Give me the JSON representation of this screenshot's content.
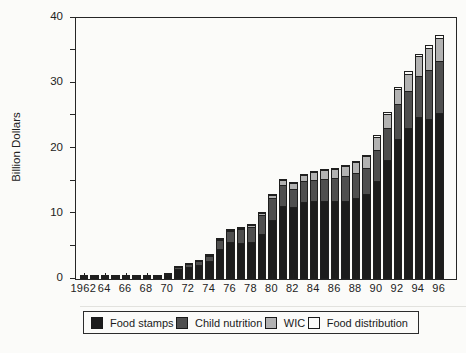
{
  "chart_data": {
    "type": "bar",
    "stacked": true,
    "title": "",
    "xlabel": "",
    "ylabel": "Billion Dollars",
    "ylim": [
      0,
      40
    ],
    "y_major_ticks": [
      0,
      10,
      20,
      30,
      40
    ],
    "y_minor_step": 5,
    "grid": "off",
    "legend_position": "bottom",
    "categories": [
      1962,
      1963,
      1964,
      1965,
      1966,
      1967,
      1968,
      1969,
      1970,
      1971,
      1972,
      1973,
      1974,
      1975,
      1976,
      1977,
      1978,
      1979,
      1980,
      1981,
      1982,
      1983,
      1984,
      1985,
      1986,
      1987,
      1988,
      1989,
      1990,
      1991,
      1992,
      1993,
      1994,
      1995,
      1996
    ],
    "x_tick_labels": [
      "1962",
      "64",
      "66",
      "68",
      "70",
      "72",
      "74",
      "76",
      "78",
      "80",
      "82",
      "84",
      "86",
      "88",
      "90",
      "92",
      "94",
      "96"
    ],
    "series": [
      {
        "name": "Food stamps",
        "color": "#1c1c1c",
        "values": [
          0.1,
          0.1,
          0.1,
          0.1,
          0.1,
          0.1,
          0.15,
          0.25,
          0.55,
          1.55,
          1.8,
          2.1,
          2.7,
          4.6,
          5.6,
          5.5,
          5.7,
          6.9,
          9.1,
          11.2,
          11.0,
          11.8,
          11.9,
          11.9,
          11.9,
          12.0,
          12.4,
          13.0,
          15.0,
          18.2,
          21.5,
          23.1,
          24.8,
          24.6,
          25.5
        ]
      },
      {
        "name": "Child nutrition",
        "color": "#4f4f4f",
        "values": [
          0.1,
          0.1,
          0.15,
          0.15,
          0.15,
          0.2,
          0.2,
          0.25,
          0.3,
          0.5,
          0.6,
          0.75,
          0.95,
          1.6,
          1.9,
          2.3,
          2.5,
          3.0,
          3.4,
          3.4,
          3.0,
          3.3,
          3.5,
          3.6,
          3.7,
          3.9,
          4.0,
          4.2,
          5.0,
          5.1,
          5.4,
          5.8,
          6.5,
          7.6,
          8.0
        ]
      },
      {
        "name": "WIC",
        "color": "#b2b2b2",
        "values": [
          0,
          0,
          0,
          0,
          0,
          0,
          0,
          0,
          0,
          0,
          0,
          0,
          0.05,
          0.1,
          0.15,
          0.3,
          0.4,
          0.55,
          0.7,
          0.9,
          0.95,
          1.1,
          1.3,
          1.5,
          1.6,
          1.7,
          1.8,
          1.9,
          2.1,
          2.3,
          2.6,
          2.9,
          3.2,
          3.5,
          3.7
        ]
      },
      {
        "name": "Food distribution",
        "color": "#fbfbf9",
        "values": [
          0.1,
          0.1,
          0.1,
          0.1,
          0.1,
          0.1,
          0.1,
          0.1,
          0.1,
          0.1,
          0.1,
          0.1,
          0.1,
          0.15,
          0.2,
          0.2,
          0.2,
          0.25,
          0.3,
          0.3,
          0.3,
          0.3,
          0.3,
          0.3,
          0.3,
          0.3,
          0.3,
          0.4,
          0.4,
          0.4,
          0.4,
          0.5,
          0.5,
          0.6,
          0.6
        ]
      }
    ]
  },
  "style": {
    "outline_color": "#1f1f1f",
    "background": "#fbfbf9",
    "axis_color": "#262626"
  }
}
